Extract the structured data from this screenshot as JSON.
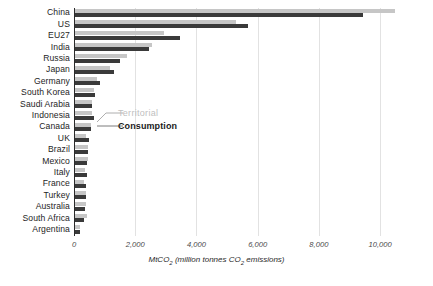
{
  "chart_data": {
    "type": "bar",
    "orientation": "horizontal",
    "title": "",
    "subtitle": "",
    "xlabel": "MtCO2 (million tonnes CO2 emissions)",
    "xlabel_parts": {
      "prefix": "MtCO",
      "sub1": "2",
      "middle": " (million tonnes CO",
      "sub2": "2",
      "suffix": " emissions)"
    },
    "ylabel": "",
    "xlim": [
      0,
      11500
    ],
    "xticks": [
      0,
      2000,
      4000,
      6000,
      8000,
      10000
    ],
    "xticklabels": [
      "0",
      "2,000",
      "4,000",
      "6,000",
      "8,000",
      "10,000"
    ],
    "grid": "vertical",
    "legend_position": "inline-annotation",
    "categories": [
      "China",
      "US",
      "EU27",
      "India",
      "Russia",
      "Japan",
      "Germany",
      "South Korea",
      "Saudi Arabia",
      "Indonesia",
      "Canada",
      "UK",
      "Brazil",
      "Mexico",
      "Italy",
      "France",
      "Turkey",
      "Australia",
      "South Africa",
      "Argentina"
    ],
    "series": [
      {
        "name": "Territorial",
        "color": "#c6c6c6",
        "values": [
          10500,
          5300,
          2950,
          2550,
          1720,
          1170,
          760,
          640,
          600,
          600,
          560,
          380,
          450,
          460,
          360,
          320,
          390,
          400,
          440,
          190
        ]
      },
      {
        "name": "Consumption",
        "color": "#3a3a3a",
        "values": [
          9450,
          5700,
          3450,
          2440,
          1510,
          1300,
          850,
          690,
          590,
          660,
          540,
          500,
          470,
          420,
          430,
          400,
          400,
          360,
          320,
          180
        ]
      }
    ],
    "annotations": [
      {
        "text": "Territorial",
        "series": "Territorial",
        "color": "#c0c0c0"
      },
      {
        "text": "Consumption",
        "series": "Consumption",
        "color": "#1a1a1a"
      }
    ]
  },
  "colors": {
    "territorial": "#c6c6c6",
    "consumption": "#3a3a3a",
    "grid": "#e2e2e2",
    "axis": "#2b2b2b",
    "background": "#ffffff",
    "tick_text": "#4a4a4a"
  }
}
